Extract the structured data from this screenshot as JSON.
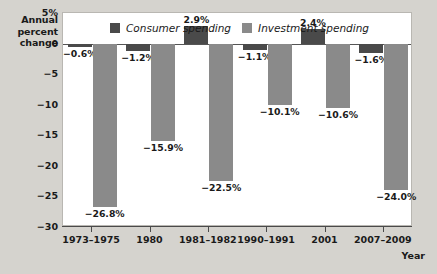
{
  "chart_data": {
    "type": "bar",
    "title": "",
    "xlabel": "Year",
    "ylabel": "Annual percent change",
    "ylabel_lines": [
      "Annual",
      "percent",
      "change"
    ],
    "categories": [
      "1973–1975",
      "1980",
      "1981–1982",
      "1990–1991",
      "2001",
      "2007–2009"
    ],
    "series": [
      {
        "name": "Consumer spending",
        "color": "#4a4a4a",
        "values": [
          -0.6,
          -1.2,
          2.9,
          -1.1,
          2.4,
          -1.6
        ],
        "labels": [
          "−0.6%",
          "−1.2%",
          "2.9%",
          "−1.1%",
          "2.4%",
          "−1.6%"
        ]
      },
      {
        "name": "Investment spending",
        "color": "#8a8a8a",
        "values": [
          -26.8,
          -15.9,
          -22.5,
          -10.1,
          -10.6,
          -24.0
        ],
        "labels": [
          "−26.8%",
          "−15.9%",
          "−22.5%",
          "−10.1%",
          "−10.6%",
          "−24.0%"
        ]
      }
    ],
    "ylim": [
      -30,
      5
    ],
    "yticks": [
      5,
      0,
      -5,
      -10,
      -15,
      -20,
      -25,
      -30
    ],
    "ytick_labels": [
      "5%",
      "0",
      "−5",
      "−10",
      "−15",
      "−20",
      "−25",
      "−30"
    ],
    "grid": false,
    "legend_position": "top-center"
  },
  "legend": {
    "items": [
      {
        "label": "Consumer spending",
        "swatch": "consumer-swatch"
      },
      {
        "label": "Investment spending",
        "swatch": "investment-swatch"
      }
    ]
  },
  "axis": {
    "y_title_line1": "Annual",
    "y_title_line2": "percent",
    "y_title_line3": "change",
    "x_title": "Year"
  }
}
